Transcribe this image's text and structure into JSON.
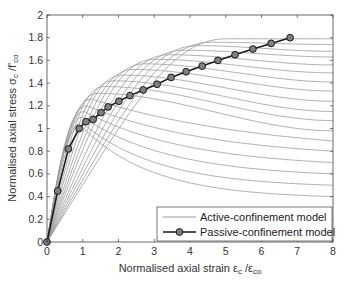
{
  "chart_data": {
    "type": "line",
    "title": "",
    "xlabel": "Normalised axial strain ε_c /ε_co",
    "ylabel": "Normalised axial stress σ_c /f'_co",
    "xlabel_parts": {
      "main": "Normalised axial strain ε",
      "sub1": "c",
      "mid": " /ε",
      "sub2": "co"
    },
    "ylabel_parts": {
      "main": "Normalised axial stress σ",
      "sub1": "c",
      "mid": " /f'",
      "sub2": "co"
    },
    "xlim": [
      0,
      8
    ],
    "ylim": [
      0,
      2
    ],
    "xticks": [
      0,
      1,
      2,
      3,
      4,
      5,
      6,
      7,
      8
    ],
    "yticks": [
      0,
      0.2,
      0.4,
      0.6,
      0.8,
      1,
      1.2,
      1.4,
      1.6,
      1.8,
      2
    ],
    "ytick_labels": [
      "0",
      "0.2",
      "0.4",
      "0.6",
      "0.8",
      "1",
      "1.2",
      "1.4",
      "1.6",
      "1.8",
      "2"
    ],
    "grid": false,
    "legend_position": "lower right",
    "legend": [
      {
        "label": "Active-confinement model",
        "style": "thin-gray-line"
      },
      {
        "label": "Passive-confinement model",
        "style": "black-line-circle-markers"
      }
    ],
    "series": [
      {
        "name": "Passive-confinement model",
        "x": [
          0,
          0.3,
          0.6,
          0.9,
          1.09,
          1.29,
          1.51,
          1.71,
          2.01,
          2.32,
          2.69,
          3.08,
          3.47,
          3.89,
          4.34,
          4.78,
          5.26,
          5.76,
          6.27,
          6.8
        ],
        "y": [
          0,
          0.45,
          0.82,
          1.0,
          1.06,
          1.08,
          1.14,
          1.19,
          1.24,
          1.29,
          1.34,
          1.39,
          1.45,
          1.5,
          1.55,
          1.6,
          1.65,
          1.7,
          1.75,
          1.8
        ]
      }
    ],
    "active_family": {
      "name": "Active-confinement model",
      "peak_strain": [
        5.0,
        4.6,
        4.2,
        3.8,
        3.4,
        3.0,
        2.7,
        2.4,
        2.1,
        1.85,
        1.6,
        1.4,
        1.25,
        1.12,
        1.05,
        1.0,
        0.98,
        0.96
      ],
      "peak_stress": [
        1.79,
        1.76,
        1.73,
        1.69,
        1.65,
        1.61,
        1.57,
        1.52,
        1.47,
        1.42,
        1.37,
        1.31,
        1.26,
        1.2,
        1.15,
        1.1,
        1.05,
        1.02
      ],
      "end_stress_at_x8": [
        1.79,
        1.74,
        1.68,
        1.63,
        1.56,
        1.49,
        1.41,
        1.33,
        1.24,
        1.15,
        1.07,
        0.98,
        0.89,
        0.8,
        0.7,
        0.6,
        0.5,
        0.4
      ]
    }
  },
  "colors": {
    "passive_line": "#1a1a1a",
    "passive_marker_fill": "#808080",
    "active_line": "#9a9a9a",
    "axis": "#444444"
  }
}
